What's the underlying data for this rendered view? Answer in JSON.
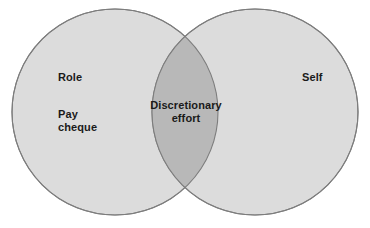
{
  "diagram": {
    "type": "venn",
    "background_color": "#ffffff",
    "set_fill_color": "#dcdcdc",
    "overlap_fill_color": "#b8b8b8",
    "stroke_color": "#7d7d7d",
    "text_color": "#1a1a1a",
    "left_set": {
      "name": "role-set",
      "labels": [
        {
          "name": "role-label",
          "text": "Role"
        },
        {
          "name": "pay-cheque-label",
          "text": "Pay\ncheque"
        }
      ]
    },
    "right_set": {
      "name": "self-set",
      "labels": [
        {
          "name": "self-label",
          "text": "Self"
        }
      ]
    },
    "intersection": {
      "name": "discretionary-effort-region",
      "label": {
        "name": "discretionary-effort-label",
        "text": "Discretionary\neffort"
      }
    }
  }
}
